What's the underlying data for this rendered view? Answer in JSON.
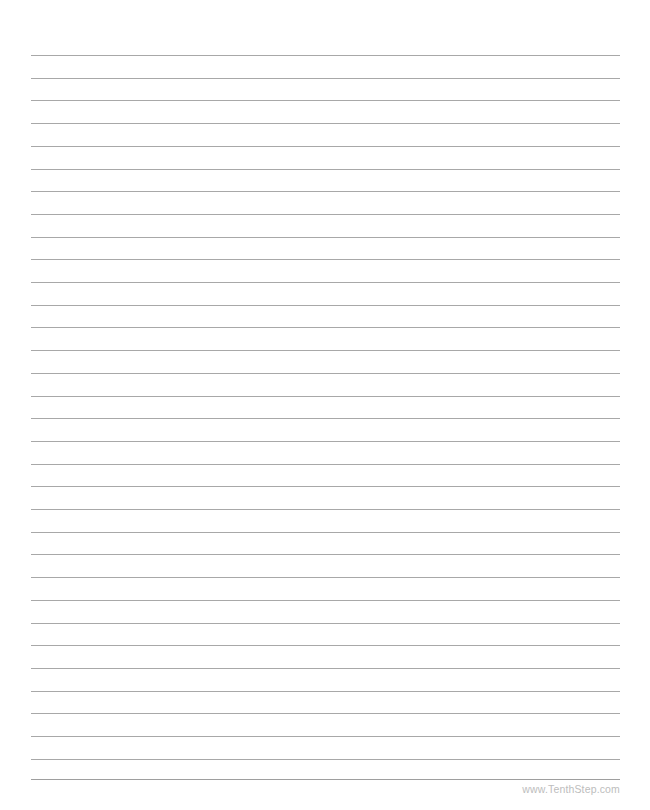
{
  "page": {
    "kind": "printable-lined-paper",
    "width": 650,
    "height": 810,
    "background_color": "#ffffff"
  },
  "ruled_lines": {
    "count": 32,
    "color": "#a8a8a8",
    "thickness_px": 1,
    "left_px": 31,
    "right_px": 620,
    "first_line_y_px": 55,
    "spacing_px": 22.7
  },
  "footer": {
    "rule_color": "#9e9e9e",
    "rule_y_px": 779,
    "credit_text": "www.TenthStep.com",
    "credit_color": "#bdbdbd"
  }
}
